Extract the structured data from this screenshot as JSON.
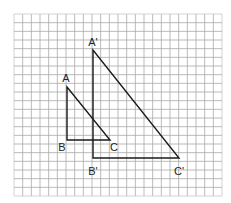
{
  "diagram": {
    "type": "grid-triangles",
    "grid": {
      "left": 14,
      "top": 14,
      "right": 222,
      "bottom": 196,
      "cols": 24,
      "rows": 21,
      "line_color": "#a8a8a8",
      "border_color": "#c8c8c8"
    },
    "triangles": [
      {
        "name": "ABC",
        "stroke": "#1a1a1a",
        "vertices": [
          {
            "label": "A",
            "x": 67,
            "y": 87,
            "lx": 66,
            "ly": 82
          },
          {
            "label": "B",
            "x": 67,
            "y": 140,
            "lx": 62,
            "ly": 151
          },
          {
            "label": "C",
            "x": 110,
            "y": 140,
            "lx": 114,
            "ly": 151
          }
        ]
      },
      {
        "name": "A'B'C'",
        "stroke": "#1a1a1a",
        "vertices": [
          {
            "label": "A'",
            "x": 93,
            "y": 50,
            "lx": 93,
            "ly": 46
          },
          {
            "label": "B'",
            "x": 93,
            "y": 158,
            "lx": 93,
            "ly": 175
          },
          {
            "label": "C'",
            "x": 179,
            "y": 158,
            "lx": 179,
            "ly": 175
          }
        ]
      }
    ]
  }
}
